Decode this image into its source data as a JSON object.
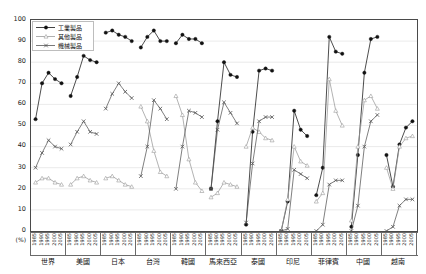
{
  "chart_data": {
    "type": "line",
    "title": "",
    "xlabel": "",
    "ylabel": "(%)",
    "ylim": [
      0,
      100
    ],
    "ytick_step": 10,
    "yticks": [
      0,
      10,
      20,
      30,
      40,
      50,
      60,
      70,
      80,
      90,
      100
    ],
    "grid": true,
    "legend_position": "top-left",
    "unit_label": "(%)",
    "years": [
      "1985",
      "1990",
      "1995",
      "2000",
      "2005"
    ],
    "legend": [
      {
        "name": "工業製品",
        "marker": "filled-diamond",
        "color": "#111111"
      },
      {
        "name": "其他製品",
        "marker": "open-triangle",
        "color": "#9a9a9a"
      },
      {
        "name": "機械製品",
        "marker": "cross-x",
        "color": "#555555"
      }
    ],
    "groups": [
      {
        "label": "世界",
        "series": [
          {
            "name": "工業製品",
            "values": [
              53,
              70,
              75,
              72,
              70
            ]
          },
          {
            "name": "其他製品",
            "values": [
              23,
              25,
              25,
              23,
              22
            ]
          },
          {
            "name": "機械製品",
            "values": [
              30,
              37,
              43,
              40,
              39
            ]
          }
        ]
      },
      {
        "label": "美國",
        "series": [
          {
            "name": "工業製品",
            "values": [
              64,
              73,
              83,
              81,
              80
            ]
          },
          {
            "name": "其他製品",
            "values": [
              22,
              25,
              26,
              24,
              23
            ]
          },
          {
            "name": "機械製品",
            "values": [
              41,
              47,
              52,
              47,
              46
            ]
          }
        ]
      },
      {
        "label": "日本",
        "series": [
          {
            "name": "工業製品",
            "values": [
              94,
              95,
              93,
              92,
              90
            ]
          },
          {
            "name": "其他製品",
            "values": [
              25,
              26,
              24,
              22,
              21
            ]
          },
          {
            "name": "機械製品",
            "values": [
              58,
              65,
              70,
              66,
              63
            ]
          }
        ]
      },
      {
        "label": "台灣",
        "series": [
          {
            "name": "工業製品",
            "values": [
              87,
              92,
              95,
              90,
              90
            ]
          },
          {
            "name": "其他製品",
            "values": [
              59,
              52,
              38,
              28,
              26
            ]
          },
          {
            "name": "機械製品",
            "values": [
              26,
              40,
              62,
              58,
              53
            ]
          }
        ]
      },
      {
        "label": "韓國",
        "series": [
          {
            "name": "工業製品",
            "values": [
              89,
              93,
              91,
              91,
              89
            ]
          },
          {
            "name": "其他製品",
            "values": [
              64,
              55,
              34,
              23,
              19
            ]
          },
          {
            "name": "機械製品",
            "values": [
              20,
              40,
              57,
              56,
              54
            ]
          }
        ]
      },
      {
        "label": "馬來西亞",
        "series": [
          {
            "name": "工業製品",
            "values": [
              20,
              52,
              80,
              74,
              73
            ]
          },
          {
            "name": "其他製品",
            "values": [
              16,
              18,
              23,
              22,
              21
            ]
          },
          {
            "name": "機械製品",
            "values": [
              20,
              48,
              61,
              56,
              51
            ]
          }
        ]
      },
      {
        "label": "泰國",
        "series": [
          {
            "name": "工業製品",
            "values": [
              3,
              47,
              76,
              77,
              76
            ]
          },
          {
            "name": "其他製品",
            "values": [
              40,
              49,
              47,
              44,
              43
            ]
          },
          {
            "name": "機械製品",
            "values": [
              4,
              32,
              52,
              54,
              54
            ]
          }
        ]
      },
      {
        "label": "印尼",
        "series": [
          {
            "name": "工業製品",
            "values": [
              0,
              14,
              57,
              48,
              45
            ]
          },
          {
            "name": "其他製品",
            "values": [
              0,
              15,
              40,
              33,
              31
            ]
          },
          {
            "name": "機械製品",
            "values": [
              0,
              1,
              29,
              27,
              25
            ]
          }
        ]
      },
      {
        "label": "菲律賓",
        "series": [
          {
            "name": "工業製品",
            "values": [
              17,
              30,
              92,
              85,
              84
            ]
          },
          {
            "name": "其他製品",
            "values": [
              14,
              18,
              72,
              57,
              50
            ]
          },
          {
            "name": "機械製品",
            "values": [
              0,
              3,
              22,
              24,
              24
            ]
          }
        ]
      },
      {
        "label": "中國",
        "series": [
          {
            "name": "工業製品",
            "values": [
              2,
              36,
              75,
              91,
              92
            ]
          },
          {
            "name": "其他製品",
            "values": [
              5,
              40,
              62,
              64,
              58
            ]
          },
          {
            "name": "機械製品",
            "values": [
              0,
              12,
              40,
              52,
              55
            ]
          }
        ]
      },
      {
        "label": "越南",
        "series": [
          {
            "name": "工業製品",
            "values": [
              36,
              21,
              41,
              49,
              52
            ]
          },
          {
            "name": "其他製品",
            "values": [
              30,
              20,
              40,
              44,
              45
            ]
          },
          {
            "name": "機械製品",
            "values": [
              0,
              2,
              12,
              15,
              15
            ]
          }
        ]
      }
    ]
  }
}
